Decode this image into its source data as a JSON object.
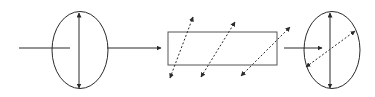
{
  "diagram": {
    "stroke_color": "#2a2a2a",
    "elements": {
      "input_polarizer": {
        "shape": "ellipse",
        "arrow": "vertical double-headed"
      },
      "plate": {
        "shape": "rectangle",
        "arrows": "three dashed diagonal double-headed"
      },
      "output_polarizer": {
        "shape": "ellipse",
        "arrows": "vertical solid + diagonal dashed double-headed"
      }
    }
  }
}
